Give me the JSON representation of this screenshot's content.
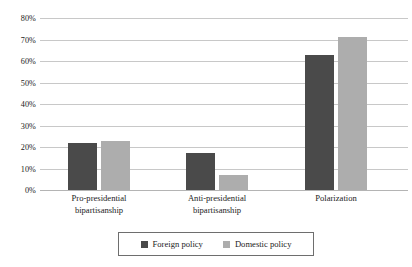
{
  "chart_data": {
    "type": "bar",
    "title": "",
    "subtitle": "",
    "xlabel": "",
    "ylabel": "",
    "categories": [
      "Pro-presidential\nbipartisanship",
      "Anti-presidential\nbipartisanship",
      "Polarization"
    ],
    "series": [
      {
        "name": "Foreign policy",
        "color": "#4a4a4a",
        "values": [
          22,
          17,
          63
        ]
      },
      {
        "name": "Domestic policy",
        "color": "#adadad",
        "values": [
          23,
          7,
          71
        ]
      }
    ],
    "ylim": [
      0,
      80
    ],
    "y_tick_step": 10,
    "y_tick_labels": [
      "0%",
      "10%",
      "20%",
      "30%",
      "40%",
      "50%",
      "60%",
      "70%",
      "80%"
    ],
    "y_tick_values": [
      0,
      10,
      20,
      30,
      40,
      50,
      60,
      70,
      80
    ],
    "value_format": "percent",
    "grid": true,
    "grid_axis": "y",
    "legend_position": "bottom",
    "legend_border": true,
    "background": "#ffffff",
    "grid_color": "#c8c8c8",
    "text_color": "#1b1b1b"
  },
  "legend": {
    "items": [
      {
        "label": "Foreign policy",
        "color": "#4a4a4a"
      },
      {
        "label": "Domestic policy",
        "color": "#adadad"
      }
    ]
  }
}
